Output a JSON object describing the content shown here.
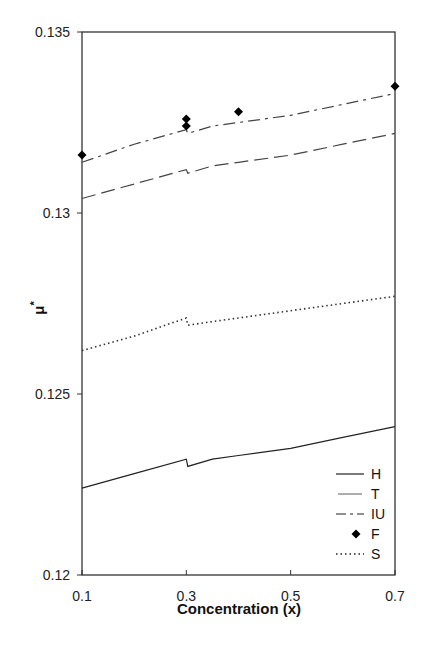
{
  "chart_data": {
    "type": "line",
    "title": "",
    "xlabel": "Concentration (x)",
    "ylabel": "μ*",
    "xlim": [
      0.1,
      0.7
    ],
    "ylim": [
      0.12,
      0.135
    ],
    "x_ticks": [
      0.1,
      0.3,
      0.5,
      0.7
    ],
    "x_tick_labels": [
      "0.1",
      "0.3",
      "0.5",
      "0.7"
    ],
    "y_ticks": [
      0.12,
      0.125,
      0.13,
      0.135
    ],
    "y_tick_labels": [
      "0.12",
      "0.125",
      "0.13",
      "0.135"
    ],
    "grid": false,
    "legend_position": "lower right (inside)",
    "legend": [
      "H",
      "T",
      "IU",
      "F",
      "S"
    ],
    "series": [
      {
        "name": "H",
        "style": "solid",
        "color": "#222222",
        "x": [
          0.1,
          0.2,
          0.3,
          0.3,
          0.35,
          0.4,
          0.5,
          0.6,
          0.7
        ],
        "values": [
          0.1224,
          0.1228,
          0.1232,
          0.123,
          0.1232,
          0.1233,
          0.1235,
          0.1238,
          0.1241
        ]
      },
      {
        "name": "T",
        "style": "long-dash",
        "color": "#444444",
        "x": [
          0.1,
          0.2,
          0.3,
          0.3,
          0.35,
          0.4,
          0.5,
          0.6,
          0.7
        ],
        "values": [
          0.1304,
          0.1308,
          0.1312,
          0.1311,
          0.1313,
          0.1314,
          0.1316,
          0.1319,
          0.1322
        ]
      },
      {
        "name": "IU",
        "style": "dash-dot",
        "color": "#444444",
        "x": [
          0.1,
          0.2,
          0.3,
          0.3,
          0.35,
          0.4,
          0.5,
          0.6,
          0.7
        ],
        "values": [
          0.1314,
          0.1319,
          0.1323,
          0.1322,
          0.1324,
          0.1325,
          0.1327,
          0.133,
          0.1333
        ]
      },
      {
        "name": "F",
        "style": "markers (diamond)",
        "color": "#000000",
        "x": [
          0.1,
          0.3,
          0.3,
          0.4,
          0.7
        ],
        "values": [
          0.1316,
          0.1326,
          0.1324,
          0.1328,
          0.1335
        ]
      },
      {
        "name": "S",
        "style": "dotted",
        "color": "#333333",
        "x": [
          0.1,
          0.2,
          0.3,
          0.3,
          0.35,
          0.4,
          0.5,
          0.6,
          0.7
        ],
        "values": [
          0.1262,
          0.1266,
          0.1271,
          0.1269,
          0.127,
          0.1271,
          0.1273,
          0.1275,
          0.1277
        ]
      }
    ]
  },
  "axes": {
    "xlabel": "Concentration (x)",
    "ylabel_main": "μ",
    "ylabel_sup": "*"
  },
  "legend": {
    "items": [
      {
        "label": "H",
        "style": "solid"
      },
      {
        "label": "T",
        "style": "long-dash"
      },
      {
        "label": "IU",
        "style": "dash-dot"
      },
      {
        "label": "F",
        "style": "diamond"
      },
      {
        "label": "S",
        "style": "dotted"
      }
    ]
  }
}
